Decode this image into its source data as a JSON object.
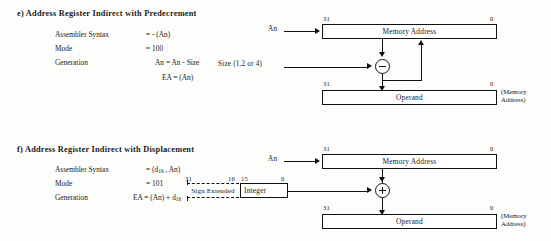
{
  "sections": [
    {
      "id": "e",
      "heading": "e) Address Register Indirect with Predecrement",
      "spec": [
        {
          "label": "Assembler  Syntax",
          "value": "= - (An)"
        },
        {
          "label": "Mode",
          "value": "= 100"
        },
        {
          "label": "Generation",
          "value": "An = An - Size"
        },
        {
          "label": "",
          "value": "EA   = (An)"
        }
      ],
      "diagram": {
        "input_label": "An",
        "operand_input_label": "Size (1,2 or 4)",
        "operator": "minus-circle",
        "upper_box": "Memory Address",
        "lower_box": "Operand",
        "upper_bits": {
          "left": "31",
          "right": "0"
        },
        "lower_bits": {
          "left": "31",
          "right": "0"
        },
        "side_note_line1": "(Memory",
        "side_note_line2": "Address)",
        "has_feedback_loop": true
      }
    },
    {
      "id": "f",
      "heading": "f) Address Register Indirect with Displacement",
      "spec": [
        {
          "label": "Assembler  Syntax",
          "value": "= (d16 , An)"
        },
        {
          "label": "Mode",
          "value": "= 101"
        },
        {
          "label": "Generation",
          "value": "EA  = (An) + d16"
        }
      ],
      "displacement_field": {
        "sign_extended_label": "Sign Extended",
        "integer_label": "Integer",
        "bits": {
          "b31": "31",
          "b16": "16",
          "b15": "15",
          "b0": "0"
        }
      },
      "diagram": {
        "input_label": "An",
        "operator": "plus-circle",
        "upper_box": "Memory Address",
        "lower_box": "Operand",
        "upper_bits": {
          "left": "31",
          "right": "0"
        },
        "lower_bits": {
          "left": "31",
          "right": "0"
        },
        "side_note_line1": "(Memory",
        "side_note_line2": "Address)",
        "has_feedback_loop": false
      }
    }
  ],
  "colors": {
    "ink": "#111111",
    "paper": "#fdfdfb"
  }
}
